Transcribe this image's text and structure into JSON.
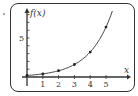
{
  "chart_data": {
    "type": "line",
    "title": "",
    "xlabel": "x",
    "ylabel": "f(x)",
    "xlim": [
      0,
      5.9
    ],
    "ylim": [
      0,
      9
    ],
    "x_ticks": [
      1,
      2,
      3,
      4,
      5
    ],
    "x_tick_labels": [
      "1",
      "2",
      "3",
      "4",
      "5"
    ],
    "y_ticks": [
      1,
      2,
      3,
      4,
      5,
      6,
      7,
      8
    ],
    "y_tick_labels": [
      "5"
    ],
    "y_labeled_tick": 5,
    "grid": false,
    "legend": "none",
    "series": [
      {
        "name": "f(x)",
        "function": "0.2 * 2^x",
        "curve_x_range": [
          0,
          5.4
        ],
        "points": [
          {
            "x": 0,
            "y": 0.2
          },
          {
            "x": 1,
            "y": 0.4
          },
          {
            "x": 2,
            "y": 0.8
          },
          {
            "x": 3,
            "y": 1.6
          },
          {
            "x": 4,
            "y": 3.2
          },
          {
            "x": 5,
            "y": 6.4
          }
        ]
      }
    ]
  },
  "colors": {
    "axis": "#333333",
    "curve": "#444444",
    "point": "#222222"
  }
}
